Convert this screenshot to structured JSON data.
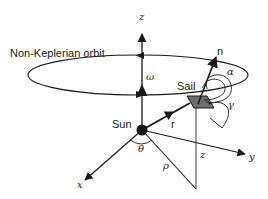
{
  "diagram": {
    "title": "Non-Keplerian orbit",
    "labels": {
      "orbit": "Non-Keplerian orbit",
      "sun": "Sun",
      "sail": "Sail",
      "axis_z_top": "z",
      "axis_x": "x",
      "axis_y": "y",
      "normal": "n",
      "radius": "r",
      "angular_velocity": "ω",
      "alpha": "α",
      "gamma": "γ",
      "theta": "θ",
      "rho": "ρ",
      "height_z": "z"
    },
    "colors": {
      "ink": "#1a1a1a",
      "sail_fill": "#6e6e6e",
      "background": "#ffffff"
    }
  }
}
